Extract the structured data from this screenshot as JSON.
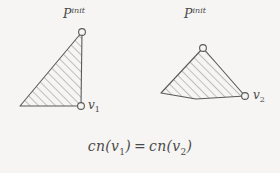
{
  "figure": {
    "background_color": "#f6f5f3",
    "stroke_color": "#5a5a5a",
    "hatch_color": "#7a7a7a",
    "caption": {
      "lhs_fn": "cn",
      "lhs_open": "(",
      "lhs_var": "v",
      "lhs_sub": "1",
      "lhs_close": ")",
      "operator": "=",
      "rhs_fn": "cn",
      "rhs_open": "(",
      "rhs_var": "v",
      "rhs_sub": "2",
      "rhs_close": ")",
      "full_text": "cn(v1) = cn(v2)"
    },
    "left_shape": {
      "name": "right-triangle-hatched",
      "label_p": {
        "base": "P",
        "sup": "init"
      },
      "label_v": {
        "base": "v",
        "sub": "1"
      },
      "vertices": [
        {
          "x": 82,
          "y": 32,
          "marker": "circle"
        },
        {
          "x": 81,
          "y": 106,
          "marker": "circle"
        },
        {
          "x": 20,
          "y": 106,
          "marker": "none"
        }
      ],
      "polygon_points": "82,32 81,106 20,106",
      "marker_radius": 3.4
    },
    "right_shape": {
      "name": "quadrilateral-hatched",
      "label_p": {
        "base": "P",
        "sup": "init"
      },
      "label_v": {
        "base": "v",
        "sub": "2"
      },
      "vertices": [
        {
          "x": 203,
          "y": 48,
          "marker": "circle"
        },
        {
          "x": 245,
          "y": 96,
          "marker": "circle"
        },
        {
          "x": 196,
          "y": 99,
          "marker": "none"
        },
        {
          "x": 161,
          "y": 93,
          "marker": "none"
        }
      ],
      "polygon_points": "203,48 245,96 196,99 161,93",
      "marker_radius": 3.4
    },
    "hatching": {
      "angle_deg": 45,
      "spacing_px": 6,
      "line_width": 0.8
    }
  }
}
